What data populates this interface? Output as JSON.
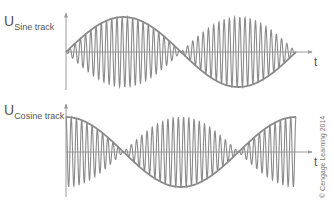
{
  "plots": [
    {
      "id": "sine",
      "label_main": "U",
      "label_sub": "Sine track",
      "t_label": "t",
      "envelope": "sine",
      "axis_x": 66,
      "axis_top": 13,
      "axis_bottom": 90,
      "zero_y": 52,
      "t_axis_end": 312,
      "signal_start": 66,
      "signal_end": 296,
      "amplitude": 35,
      "carrier_cycles": 44
    },
    {
      "id": "cosine",
      "label_main": "U",
      "label_sub": "Cosine track",
      "t_label": "t",
      "envelope": "cosine",
      "axis_x": 66,
      "axis_top": 104,
      "axis_bottom": 197,
      "zero_y": 152,
      "t_axis_end": 312,
      "signal_start": 66,
      "signal_end": 296,
      "amplitude": 35,
      "carrier_cycles": 44
    }
  ],
  "copyright": "© Cengage Learning 2014",
  "colors": {
    "line": "#8a8a8a",
    "axis": "#9a9a9a",
    "text": "#555555"
  }
}
